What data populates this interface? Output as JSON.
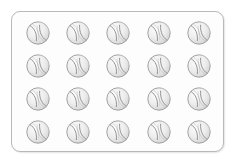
{
  "scene": {
    "description": "Tray of sports balls",
    "background_color": "#ffffff"
  },
  "tray": {
    "name": "ball-tray",
    "fill_color": "#fdfdfd",
    "border_color": "#b9b9b9",
    "corner_radius_px": 9,
    "left_px": 11,
    "top_px": 11,
    "width_px": 213,
    "height_px": 141
  },
  "grid": {
    "rows": 4,
    "columns": 5,
    "total_items": 20,
    "item_label": "ball",
    "item_diameter_px": 24
  },
  "ball": {
    "type": "baseball",
    "body_color": "#eeeeee",
    "body_highlight_color": "#fbfbfb",
    "outline_color": "#9a9a9a",
    "seam_color": "#8e8e8e",
    "shading_color": "#d6d6d6"
  },
  "items": [
    {
      "row": 1,
      "col": 1,
      "label": "ball-1"
    },
    {
      "row": 1,
      "col": 2,
      "label": "ball-2"
    },
    {
      "row": 1,
      "col": 3,
      "label": "ball-3"
    },
    {
      "row": 1,
      "col": 4,
      "label": "ball-4"
    },
    {
      "row": 1,
      "col": 5,
      "label": "ball-5"
    },
    {
      "row": 2,
      "col": 1,
      "label": "ball-6"
    },
    {
      "row": 2,
      "col": 2,
      "label": "ball-7"
    },
    {
      "row": 2,
      "col": 3,
      "label": "ball-8"
    },
    {
      "row": 2,
      "col": 4,
      "label": "ball-9"
    },
    {
      "row": 2,
      "col": 5,
      "label": "ball-10"
    },
    {
      "row": 3,
      "col": 1,
      "label": "ball-11"
    },
    {
      "row": 3,
      "col": 2,
      "label": "ball-12"
    },
    {
      "row": 3,
      "col": 3,
      "label": "ball-13"
    },
    {
      "row": 3,
      "col": 4,
      "label": "ball-14"
    },
    {
      "row": 3,
      "col": 5,
      "label": "ball-15"
    },
    {
      "row": 4,
      "col": 1,
      "label": "ball-16"
    },
    {
      "row": 4,
      "col": 2,
      "label": "ball-17"
    },
    {
      "row": 4,
      "col": 3,
      "label": "ball-18"
    },
    {
      "row": 4,
      "col": 4,
      "label": "ball-19"
    },
    {
      "row": 4,
      "col": 5,
      "label": "ball-20"
    }
  ]
}
